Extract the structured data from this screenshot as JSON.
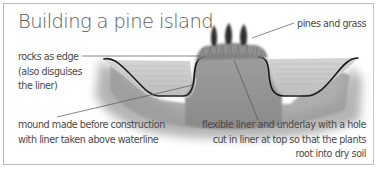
{
  "diagram": {
    "title": "Building a pine island",
    "labels": {
      "rocks": {
        "lines": [
          "rocks as edge",
          "(also disguises",
          "the liner)"
        ]
      },
      "pines": {
        "lines": [
          "pines and grass"
        ]
      },
      "mound": {
        "lines": [
          "mound made before construction",
          "with liner taken above waterline"
        ]
      },
      "liner": {
        "lines": [
          "flexible liner and underlay with a hole",
          "cut in liner at top so that the plants",
          "root into dry soil"
        ]
      }
    },
    "illustration": {
      "subject": "cross-section of pond with central planted island mound",
      "elements": [
        "pond-bank-left",
        "water-left",
        "island-mound",
        "pine-trees",
        "water-right",
        "pond-bank-right",
        "flexible-liner"
      ]
    },
    "colors": {
      "text": "#4a4a4a",
      "title": "#5a5a5a",
      "liner": "#1a1a1a",
      "water": "#c9c9c9",
      "soil": "#9a9a9a",
      "leader_line": "#555555",
      "border": "#b8b8b8"
    }
  }
}
